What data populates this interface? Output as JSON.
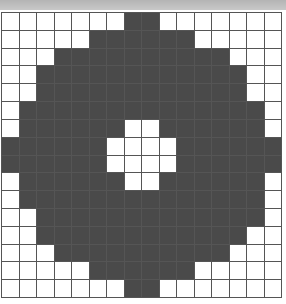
{
  "header": {
    "text": ""
  },
  "grid": {
    "rows": 16,
    "cols": 16,
    "colors": {
      "filled": "#4a4a4a",
      "empty": "#ffffff",
      "line": "#555555"
    },
    "cells": [
      "0000000110000000",
      "0000011111100000",
      "0001111111111000",
      "0011111111111100",
      "0011111111111100",
      "0111111111111110",
      "0111111001111110",
      "1111110000111111",
      "1111110000111111",
      "0111111001111110",
      "0111111111111110",
      "0011111111111110",
      "0011111111111100",
      "0001111111111000",
      "0000011111100000",
      "0000000110000000"
    ]
  }
}
